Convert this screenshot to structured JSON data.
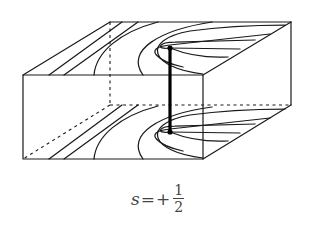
{
  "figure": {
    "type": "disclination-defect-diagram",
    "box": {
      "front_face": {
        "x1": 23,
        "y1": 75,
        "x2": 203,
        "y2": 159
      },
      "back_offset": {
        "dx": 87,
        "dy": -53
      }
    },
    "defect_line": {
      "x": 170,
      "y_top": 48,
      "y_bottom": 132
    }
  },
  "caption": {
    "symbol": "s",
    "equals": "=",
    "sign": "+",
    "numerator": "1",
    "denominator": "2"
  }
}
